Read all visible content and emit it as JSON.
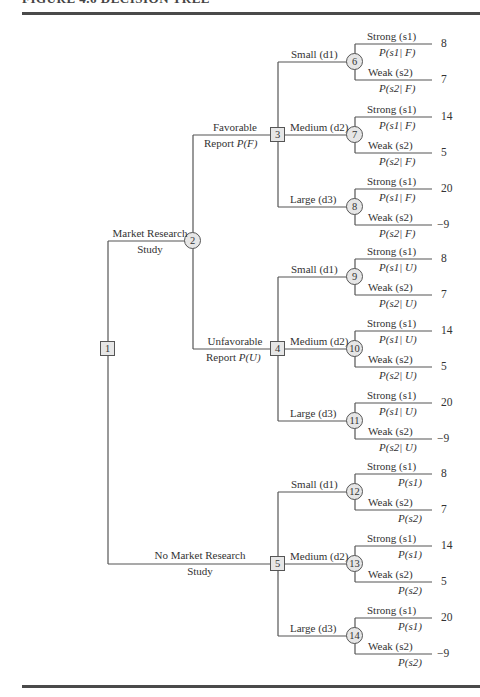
{
  "caption": "FIGURE 4.6   DECISION TREE",
  "tree": {
    "root": {
      "id": "1",
      "type": "decision"
    },
    "research_branch": {
      "line1": "Market Research",
      "line2": "Study",
      "node": "2"
    },
    "no_research_branch": {
      "line1": "No Market Research",
      "line2": "Study",
      "node": "5"
    },
    "favorable": {
      "line1": "Favorable",
      "line2": "Report",
      "prob": "P(F)",
      "node": "3"
    },
    "unfavorable": {
      "line1": "Unfavorable",
      "line2": "Report",
      "prob": "P(U)",
      "node": "4"
    },
    "decisions": {
      "small": "Small (d1)",
      "medium": "Medium (d2)",
      "large": "Large (d3)"
    },
    "states": {
      "strong": "Strong (s1)",
      "weak": "Weak (s2)"
    },
    "chance_nodes": [
      {
        "id": "6",
        "decision": "Small",
        "p_strong": "P(s1| F)",
        "p_weak": "P(s2| F)",
        "payoff_strong": "8",
        "payoff_weak": "7"
      },
      {
        "id": "7",
        "decision": "Medium",
        "p_strong": "P(s1| F)",
        "p_weak": "P(s2| F)",
        "payoff_strong": "14",
        "payoff_weak": "5"
      },
      {
        "id": "8",
        "decision": "Large",
        "p_strong": "P(s1| F)",
        "p_weak": "P(s2| F)",
        "payoff_strong": "20",
        "payoff_weak": "−9"
      },
      {
        "id": "9",
        "decision": "Small",
        "p_strong": "P(s1| U)",
        "p_weak": "P(s2| U)",
        "payoff_strong": "8",
        "payoff_weak": "7"
      },
      {
        "id": "10",
        "decision": "Medium",
        "p_strong": "P(s1| U)",
        "p_weak": "P(s2| U)",
        "payoff_strong": "14",
        "payoff_weak": "5"
      },
      {
        "id": "11",
        "decision": "Large",
        "p_strong": "P(s1| U)",
        "p_weak": "P(s2| U)",
        "payoff_strong": "20",
        "payoff_weak": "−9"
      },
      {
        "id": "12",
        "decision": "Small",
        "p_strong": "P(s1)",
        "p_weak": "P(s2)",
        "payoff_strong": "8",
        "payoff_weak": "7"
      },
      {
        "id": "13",
        "decision": "Medium",
        "p_strong": "P(s1)",
        "p_weak": "P(s2)",
        "payoff_strong": "14",
        "payoff_weak": "5"
      },
      {
        "id": "14",
        "decision": "Large",
        "p_strong": "P(s1)",
        "p_weak": "P(s2)",
        "payoff_strong": "20",
        "payoff_weak": "−9"
      }
    ]
  },
  "colors": {
    "line": "#555555",
    "node_fill": "#e6e6e6",
    "rule": "#4a4a4a"
  }
}
